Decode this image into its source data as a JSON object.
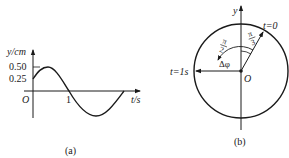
{
  "panel_a": {
    "caption": "(a)",
    "y_label": "y/cm",
    "x_label": "t/s",
    "origin_label": "O",
    "y_ticks": [
      "0.50",
      "0.25"
    ],
    "x_ticks": [
      "1"
    ],
    "curve": "y = 0.5 sin(5πt/6 + π/6) cm (starts at 0.25, peak 0.50, zero at t=1)"
  },
  "panel_b": {
    "caption": "(b)",
    "y_label": "y",
    "origin_label": "O",
    "vector_t0_label": "t=0",
    "vector_t1_label": "t=1s",
    "angle_pi3": {
      "num": "π",
      "den": "3"
    },
    "angle_pi2": {
      "num": "π",
      "den": "2"
    },
    "delta_phi_label": "Δφ"
  },
  "colors": {
    "ink": "#1a1a1a",
    "background": "#ffffff"
  }
}
